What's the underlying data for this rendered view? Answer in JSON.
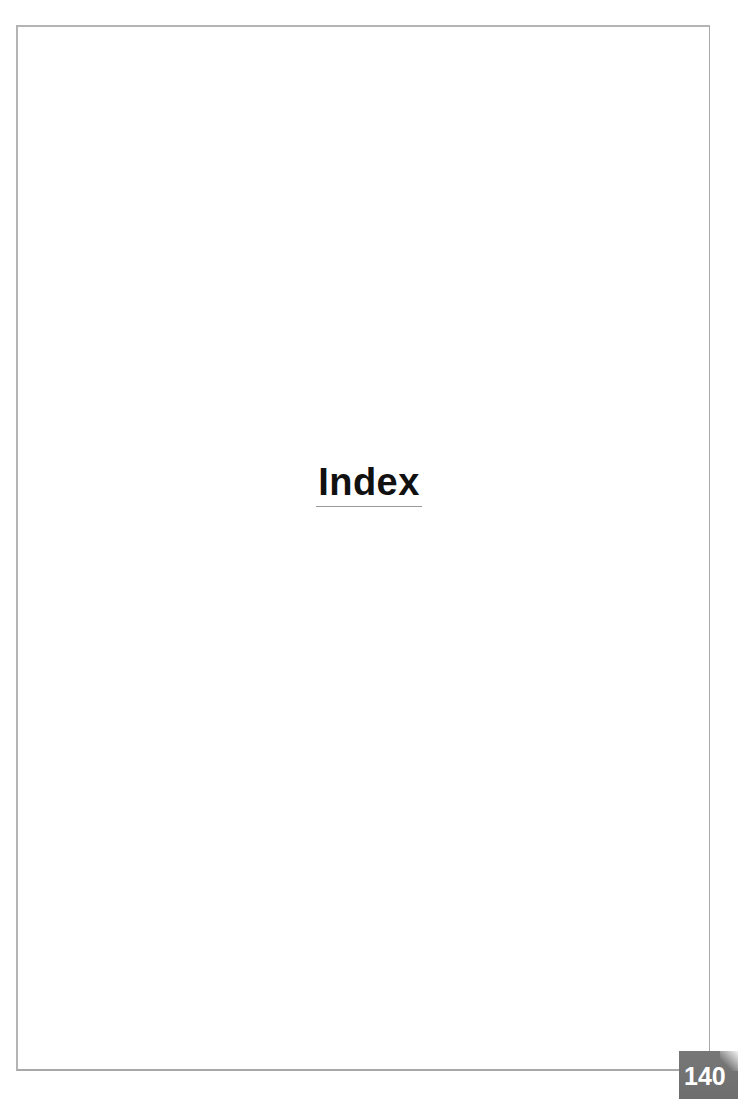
{
  "page": {
    "title": "Index",
    "page_number": "140"
  },
  "colors": {
    "frame": "#b4b4b4",
    "title": "#111111",
    "title_underline": "#9a9a9a",
    "page_number_box": "#737373",
    "page_number_text": "#ffffff"
  }
}
